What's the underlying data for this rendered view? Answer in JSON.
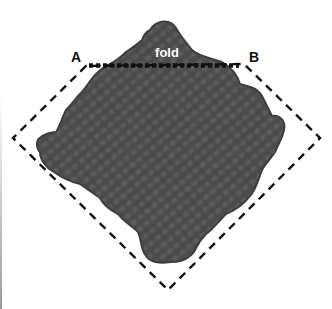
{
  "diagram": {
    "labels": {
      "corner_a": "A",
      "corner_b": "B",
      "fold": "fold"
    },
    "colors": {
      "swatch": "#4a4a4a",
      "swatch_stitch": "#3a3a3a",
      "outline": "#111111",
      "fold_text": "#ffffff",
      "label_text": "#111111"
    },
    "lines": {
      "outline_style": "dashed",
      "fold_style": "dotted"
    }
  }
}
